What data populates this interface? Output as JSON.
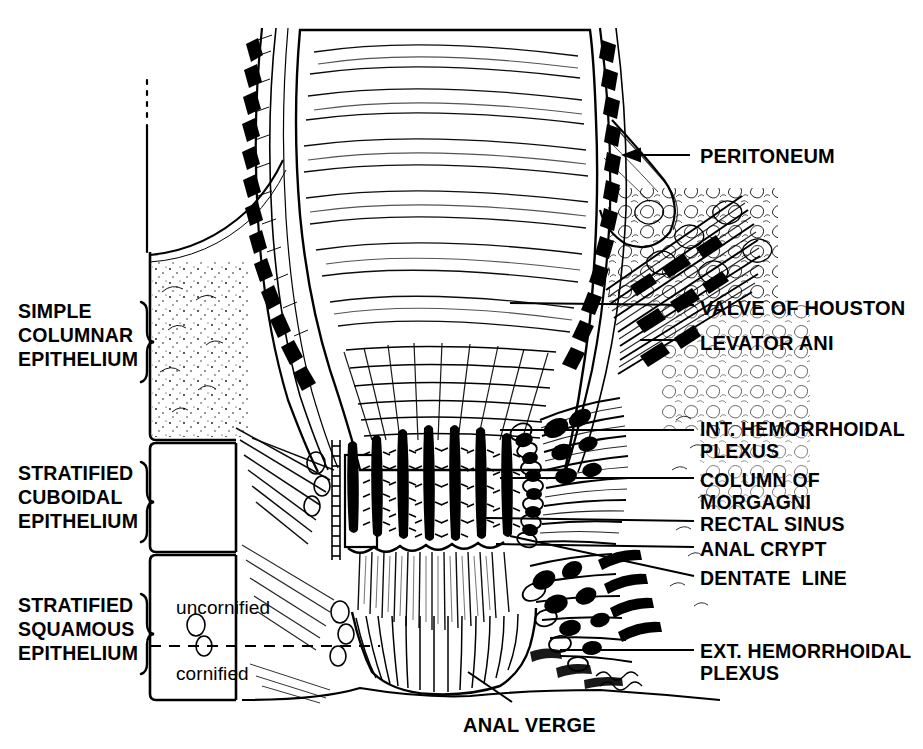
{
  "figure": {
    "style": "pen-and-ink line drawing, black on white",
    "ink_color": "#000000",
    "background_color": "#ffffff"
  },
  "left_labels": [
    {
      "name": "simple-columnar-epithelium",
      "lines": "SIMPLE\nCOLUMNAR\nEPITHELIUM",
      "x": 18,
      "y": 300
    },
    {
      "name": "stratified-cuboidal-epithelium",
      "lines": "STRATIFIED\nCUBOIDAL\nEPITHELIUM",
      "x": 18,
      "y": 462
    },
    {
      "name": "stratified-squamous-epithelium",
      "lines": "STRATIFIED\nSQUAMOUS\nEPITHELIUM",
      "x": 18,
      "y": 594
    }
  ],
  "inline_labels": [
    {
      "name": "uncornified",
      "text": "uncornified",
      "x": 176,
      "y": 597
    },
    {
      "name": "cornified",
      "text": "cornified",
      "x": 176,
      "y": 663
    }
  ],
  "right_labels": [
    {
      "name": "peritoneum",
      "lines": "PERITONEUM",
      "x": 700,
      "y": 145
    },
    {
      "name": "valve-of-houston",
      "lines": "VALVE OF HOUSTON",
      "x": 700,
      "y": 297
    },
    {
      "name": "levator-ani",
      "lines": "LEVATOR ANI",
      "x": 700,
      "y": 332
    },
    {
      "name": "int-hemorrhoidal-plexus",
      "lines": "INT. HEMORRHOIDAL\nPLEXUS",
      "x": 700,
      "y": 418
    },
    {
      "name": "column-of-morgagni",
      "lines": "COLUMN OF\nMORGAGNI",
      "x": 700,
      "y": 469
    },
    {
      "name": "rectal-sinus",
      "lines": "RECTAL SINUS",
      "x": 700,
      "y": 513
    },
    {
      "name": "anal-crypt",
      "lines": "ANAL CRYPT",
      "x": 700,
      "y": 538
    },
    {
      "name": "dentate-line",
      "lines": "DENTATE  LINE",
      "x": 700,
      "y": 567
    },
    {
      "name": "ext-hemorrhoidal-plexus",
      "lines": "EXT. HEMORRHOIDAL\nPLEXUS",
      "x": 700,
      "y": 640
    }
  ],
  "bottom_labels": [
    {
      "name": "anal-verge",
      "text": "ANAL VERGE",
      "x": 463,
      "y": 714
    }
  ]
}
